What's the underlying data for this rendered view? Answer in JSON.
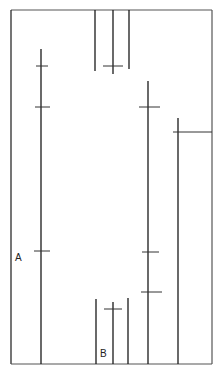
{
  "diagram": {
    "stroke_color": "#1a1a1a",
    "tick_color": "#333333",
    "border_color": "#555555",
    "border": {
      "left": 11,
      "top": 10,
      "right": 212,
      "bottom": 364,
      "open_side": "none"
    },
    "labels": [
      {
        "id": "A",
        "text": "A",
        "x": 15,
        "y": 253
      },
      {
        "id": "B",
        "text": "B",
        "x": 100,
        "y": 349
      }
    ],
    "verticals": [
      {
        "id": "left-long",
        "x": 41,
        "y1": 49,
        "y2": 364
      },
      {
        "id": "top-left",
        "x": 95,
        "y1": 10,
        "y2": 71
      },
      {
        "id": "top-mid",
        "x": 113,
        "y1": 10,
        "y2": 74
      },
      {
        "id": "top-right",
        "x": 129,
        "y1": 10,
        "y2": 69
      },
      {
        "id": "bottom-left",
        "x": 96,
        "y1": 299,
        "y2": 364
      },
      {
        "id": "bottom-mid",
        "x": 113,
        "y1": 302,
        "y2": 364
      },
      {
        "id": "bottom-right",
        "x": 128,
        "y1": 298,
        "y2": 364
      },
      {
        "id": "right-long",
        "x": 148,
        "y1": 81,
        "y2": 364
      },
      {
        "id": "far-right",
        "x": 178,
        "y1": 118,
        "y2": 364
      }
    ],
    "ticks": [
      {
        "id": "left-tick-1",
        "x1": 36,
        "x2": 48,
        "y": 66
      },
      {
        "id": "left-tick-2",
        "x1": 35,
        "x2": 50,
        "y": 107
      },
      {
        "id": "left-tick-3",
        "x1": 34,
        "x2": 50,
        "y": 251
      },
      {
        "id": "top-mid-tick",
        "x1": 103,
        "x2": 123,
        "y": 66
      },
      {
        "id": "bottom-mid-tick",
        "x1": 104,
        "x2": 122,
        "y": 309
      },
      {
        "id": "right-tick-1",
        "x1": 139,
        "x2": 160,
        "y": 107
      },
      {
        "id": "right-tick-2",
        "x1": 142,
        "x2": 159,
        "y": 252
      },
      {
        "id": "right-tick-3",
        "x1": 141,
        "x2": 162,
        "y": 292
      },
      {
        "id": "far-right-bar",
        "x1": 173,
        "x2": 212,
        "y": 132
      }
    ]
  }
}
